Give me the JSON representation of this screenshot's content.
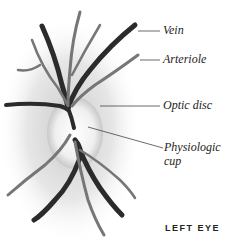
{
  "labels": {
    "vein": "Vein",
    "arteriole": "Arteriole",
    "optic_disc": "Optic disc",
    "physiologic_cup_line1": "Physiologic",
    "physiologic_cup_line2": "cup"
  },
  "caption": "LEFT EYE",
  "colors": {
    "vein": "#2a2a2a",
    "arteriole": "#6a6a6a",
    "disc": "#f4f4f4",
    "fundus": "#bdbdbd"
  }
}
